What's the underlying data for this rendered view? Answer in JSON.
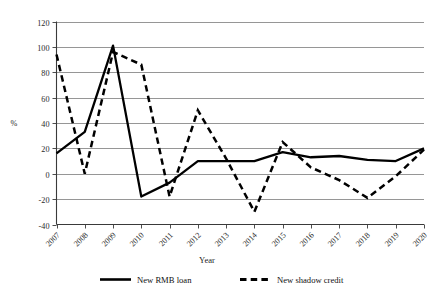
{
  "chart_data": {
    "type": "line",
    "title": "",
    "xlabel": "Year",
    "ylabel": "%",
    "categories": [
      "2007",
      "2008",
      "2009",
      "2010",
      "2011",
      "2012",
      "2013",
      "2014",
      "2015",
      "2016",
      "2017",
      "2018",
      "2019",
      "2020"
    ],
    "x": [
      2007,
      2008,
      2009,
      2010,
      2011,
      2012,
      2013,
      2014,
      2015,
      2016,
      2017,
      2018,
      2019,
      2020
    ],
    "series": [
      {
        "name": "New RMB loan",
        "style": "solid",
        "color": "#000000",
        "values": [
          16,
          33,
          101,
          -18,
          -7,
          10,
          10,
          10,
          17,
          13,
          14,
          11,
          10,
          20
        ]
      },
      {
        "name": "New shadow credit",
        "style": "dashed",
        "color": "#000000",
        "values": [
          94,
          0,
          96,
          86,
          -18,
          50,
          12,
          -30,
          25,
          5,
          -5,
          -19,
          -2,
          19
        ]
      }
    ],
    "ylim": [
      -40,
      120
    ],
    "xlim": [
      2007,
      2020
    ],
    "yticks": [
      120,
      100,
      80,
      60,
      40,
      20,
      0,
      -20,
      -40
    ],
    "ytick_labels": [
      "120",
      "100",
      "80",
      "60",
      "40",
      "20",
      "0",
      "-20",
      "-40"
    ],
    "grid": true,
    "grid_axis": "y",
    "legend_position": "bottom"
  },
  "axes": {
    "y_title": "%",
    "x_title": "Year"
  },
  "legend": {
    "items": [
      {
        "label": "New RMB loan",
        "style": "solid"
      },
      {
        "label": "New shadow credit",
        "style": "dashed"
      }
    ]
  }
}
